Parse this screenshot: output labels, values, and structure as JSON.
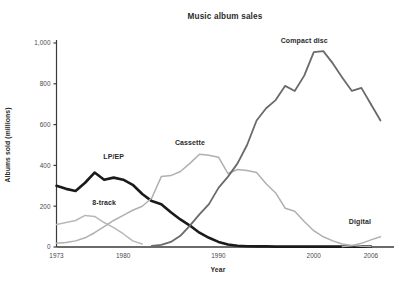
{
  "chart_data": {
    "type": "line",
    "title": "Music album sales",
    "xlabel": "Year",
    "ylabel": "Albums sold (millions)",
    "xlim": [
      1973,
      2008
    ],
    "ylim": [
      0,
      1000
    ],
    "xticks": [
      "1973",
      "1980",
      "1990",
      "2000",
      "2006"
    ],
    "xtick_values": [
      1973,
      1980,
      1990,
      2000,
      2006
    ],
    "yticks": [
      "0",
      "200",
      "400",
      "600",
      "800",
      "1,000"
    ],
    "ytick_values": [
      0,
      200,
      400,
      600,
      800,
      1000
    ],
    "grid": false,
    "legend_position": "inline-labels",
    "series": [
      {
        "name": "LP/EP",
        "label": "LP/EP",
        "color": "#1a1a1a",
        "width": 2.6,
        "label_x": 1979,
        "label_y": 430,
        "x": [
          1973,
          1974,
          1975,
          1976,
          1977,
          1978,
          1979,
          1980,
          1981,
          1982,
          1983,
          1984,
          1985,
          1986,
          1987,
          1988,
          1989,
          1990,
          1991,
          1992,
          1993,
          1994,
          1995,
          1996,
          2000,
          2006
        ],
        "values": [
          300,
          285,
          275,
          315,
          365,
          330,
          340,
          330,
          305,
          260,
          225,
          210,
          170,
          135,
          105,
          70,
          45,
          25,
          12,
          6,
          4,
          3,
          3,
          2,
          2,
          2
        ]
      },
      {
        "name": "8-track",
        "label": "8-track",
        "color": "#b8b8b8",
        "width": 1.5,
        "label_x": 1978,
        "label_y": 205,
        "x": [
          1973,
          1974,
          1975,
          1976,
          1977,
          1978,
          1979,
          1980,
          1981,
          1982
        ],
        "values": [
          110,
          120,
          130,
          155,
          150,
          120,
          95,
          65,
          30,
          15
        ]
      },
      {
        "name": "Cassette",
        "label": "Cassette",
        "color": "#b0b0b0",
        "width": 1.5,
        "label_x": 1987,
        "label_y": 500,
        "x": [
          1973,
          1974,
          1975,
          1976,
          1977,
          1978,
          1979,
          1980,
          1981,
          1982,
          1983,
          1984,
          1985,
          1986,
          1987,
          1988,
          1989,
          1990,
          1991,
          1992,
          1993,
          1994,
          1995,
          1996,
          1997,
          1998,
          1999,
          2000,
          2001,
          2002,
          2003,
          2004,
          2005,
          2006
        ],
        "values": [
          18,
          22,
          30,
          45,
          70,
          100,
          130,
          155,
          180,
          200,
          240,
          345,
          350,
          370,
          410,
          455,
          450,
          440,
          360,
          380,
          375,
          365,
          310,
          265,
          190,
          175,
          125,
          80,
          50,
          30,
          15,
          8,
          4,
          3
        ]
      },
      {
        "name": "Compact disc",
        "label": "Compact disc",
        "color": "#6a6a6a",
        "width": 1.8,
        "label_x": 1999,
        "label_y": 1000,
        "x": [
          1983,
          1984,
          1985,
          1986,
          1987,
          1988,
          1989,
          1990,
          1991,
          1992,
          1993,
          1994,
          1995,
          1996,
          1997,
          1998,
          1999,
          2000,
          2001,
          2002,
          2003,
          2004,
          2005,
          2006
        ],
        "values": [
          5,
          10,
          25,
          55,
          105,
          160,
          210,
          290,
          345,
          410,
          500,
          620,
          680,
          720,
          790,
          765,
          840,
          955,
          960,
          900,
          830,
          765,
          780,
          700
        ]
      },
      {
        "name": "Digital",
        "label": "Digital",
        "color": "#b0b0b0",
        "width": 1.5,
        "label_x": 2006,
        "label_y": 115,
        "x": [
          2003,
          2004,
          2005,
          2006,
          2007
        ],
        "values": [
          2,
          6,
          18,
          35,
          50
        ]
      },
      {
        "name": "Compact disc tail",
        "label": "",
        "color": "#6a6a6a",
        "width": 1.8,
        "label_x": null,
        "label_y": null,
        "x": [
          2006,
          2007
        ],
        "values": [
          700,
          620
        ]
      }
    ]
  }
}
